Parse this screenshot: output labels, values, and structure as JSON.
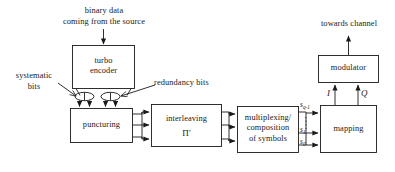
{
  "diagram": {
    "line_color": "#1a1a1a",
    "text_color": "#1a1a1a",
    "background": "#ffffff",
    "blocks": [
      {
        "id": "turbo_encoder",
        "line1": "turbo",
        "line2": "encoder"
      },
      {
        "id": "puncturing",
        "line1": "puncturing",
        "line2": ""
      },
      {
        "id": "interleaving",
        "line1": "interleaving",
        "line2": "Π'"
      },
      {
        "id": "multiplexing",
        "line1": "multiplexing/",
        "line2": "composition",
        "line3": "of symbols"
      },
      {
        "id": "mapping",
        "line1": "mapping",
        "line2": ""
      },
      {
        "id": "modulator",
        "line1": "modulator",
        "line2": ""
      }
    ],
    "annotations": [
      {
        "id": "source_input",
        "line1": "binary data",
        "line2": "coming from the source"
      },
      {
        "id": "systematic_bits",
        "line1": "systematic",
        "line2": "bits"
      },
      {
        "id": "redundancy_bits",
        "line1": "redundancy bits",
        "line2": ""
      },
      {
        "id": "towards_channel",
        "line1": "towards channel",
        "line2": ""
      }
    ],
    "signal_labels": {
      "s_top": "s",
      "s_top_sub": "q-1",
      "s_mid": "s",
      "s_mid_sub": "1",
      "s_bot": "s",
      "s_bot_sub": "0",
      "i_branch": "I",
      "q_branch": "Q"
    }
  }
}
